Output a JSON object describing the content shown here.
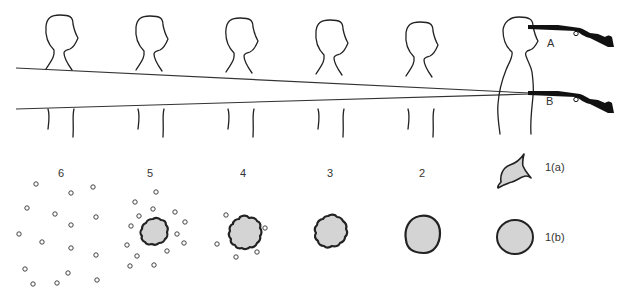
{
  "diagram": {
    "rifle_labels": {
      "a": "A",
      "b": "B"
    },
    "stage_labels": {
      "s6": "6",
      "s5": "5",
      "s4": "4",
      "s3": "3",
      "s2": "2",
      "s1a": "1(a)",
      "s1b": "1(b)"
    },
    "colors": {
      "line": "#222222",
      "fill": "#d4d4d4",
      "rifle": "#111111"
    }
  }
}
